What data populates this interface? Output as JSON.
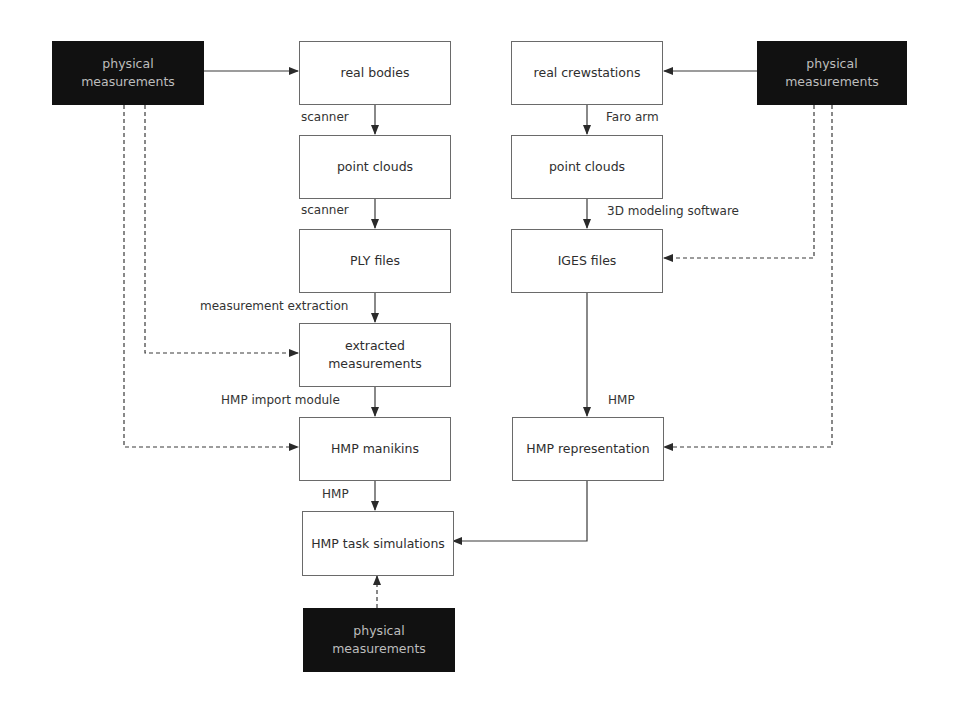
{
  "diagram": {
    "nodes": {
      "pm_left": "physical\nmeasurements",
      "real_bodies": "real bodies",
      "pc_left": "point clouds",
      "ply": "PLY files",
      "extracted": "extracted\nmeasurements",
      "manikins": "HMP manikins",
      "task_sim": "HMP task simulations",
      "pm_bottom": "physical\nmeasurements",
      "real_crew": "real crewstations",
      "pc_right": "point clouds",
      "iges": "IGES files",
      "hmp_rep": "HMP representation",
      "pm_right": "physical\nmeasurements"
    },
    "edge_labels": {
      "scanner_1": "scanner",
      "scanner_2": "scanner",
      "measurement_extraction": "measurement extraction",
      "hmp_import": "HMP import module",
      "hmp_left": "HMP",
      "faro": "Faro arm",
      "modeling": "3D modeling software",
      "hmp_right": "HMP"
    },
    "colors": {
      "dark_box": "#111111",
      "dark_text": "#bdbdbd",
      "line": "#3a3a3a"
    }
  }
}
